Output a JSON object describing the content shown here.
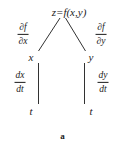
{
  "figure": {
    "caption": "a",
    "background_color": "#ffffff",
    "ink_color": "#1b1b1b"
  },
  "nodes": {
    "root": "z=f(x,y)",
    "left_mid": "x",
    "right_mid": "y",
    "left_leaf": "t",
    "right_leaf": "t"
  },
  "edge_labels": {
    "root_to_x": {
      "numerator": "∂f",
      "denominator": "∂x"
    },
    "root_to_y": {
      "numerator": "∂f",
      "denominator": "∂y"
    },
    "x_to_t": {
      "numerator": "dx",
      "denominator": "dt"
    },
    "y_to_t": {
      "numerator": "dy",
      "denominator": "dt"
    }
  }
}
